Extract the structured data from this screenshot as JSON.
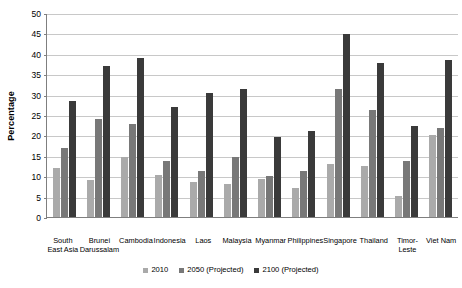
{
  "chart_data": {
    "type": "bar",
    "title": "",
    "xlabel": "",
    "ylabel": "Percentage",
    "ylim": [
      0,
      50
    ],
    "ytick_step": 5,
    "yticks": [
      "50",
      "45",
      "40",
      "35",
      "30",
      "25",
      "20",
      "15",
      "10",
      "5",
      "0"
    ],
    "grid": true,
    "legend_position": "bottom",
    "categories": [
      "South East Asia",
      "Brunei Darussalam",
      "Cambodia",
      "Indonesia",
      "Laos",
      "Malaysia",
      "Myanmar",
      "Philippines",
      "Singapore",
      "Thailand",
      "Timor-Leste",
      "Viet Nam"
    ],
    "series": [
      {
        "name": "2010",
        "color": "#aaaaaa",
        "values": [
          12.0,
          9.0,
          14.7,
          10.3,
          8.7,
          8.1,
          9.3,
          7.2,
          13.0,
          12.4,
          5.2,
          20.2
        ]
      },
      {
        "name": "2050 (Projected)",
        "color": "#787878",
        "values": [
          17.0,
          24.0,
          22.8,
          13.8,
          11.4,
          14.7,
          10.0,
          11.3,
          31.3,
          26.2,
          13.8,
          21.7
        ]
      },
      {
        "name": "2100 (Projected)",
        "color": "#3a3a3a",
        "values": [
          28.5,
          36.9,
          39.0,
          27.0,
          30.4,
          31.3,
          19.6,
          21.1,
          44.8,
          37.8,
          22.2,
          38.6
        ]
      }
    ]
  },
  "axis": {
    "y_title": "Percentage"
  }
}
